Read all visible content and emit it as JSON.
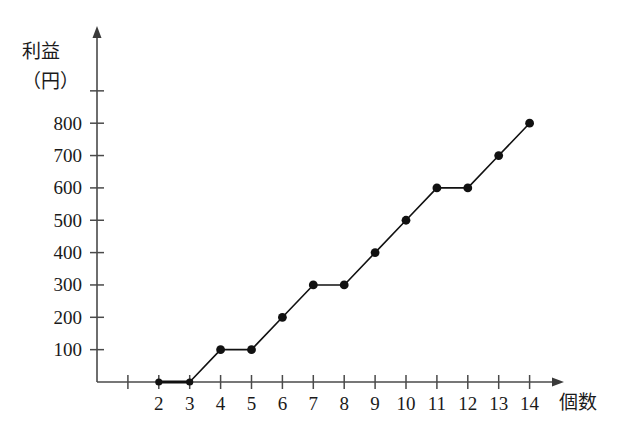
{
  "chart_data": {
    "type": "line",
    "title": "",
    "subtitle": "",
    "xlabel": "個数",
    "ylabel": "利益\n（円）",
    "ylabel_line1": "利益",
    "ylabel_line2": "（円）",
    "x": [
      2,
      3,
      4,
      5,
      6,
      7,
      8,
      9,
      10,
      11,
      12,
      13,
      14
    ],
    "values": [
      0,
      0,
      100,
      100,
      200,
      300,
      300,
      400,
      500,
      600,
      600,
      700,
      800
    ],
    "series": [
      {
        "name": "利益",
        "points": [
          {
            "x": 2,
            "y": 0
          },
          {
            "x": 3,
            "y": 0
          },
          {
            "x": 4,
            "y": 100
          },
          {
            "x": 5,
            "y": 100
          },
          {
            "x": 6,
            "y": 200
          },
          {
            "x": 7,
            "y": 300
          },
          {
            "x": 8,
            "y": 300
          },
          {
            "x": 9,
            "y": 400
          },
          {
            "x": 10,
            "y": 500
          },
          {
            "x": 11,
            "y": 600
          },
          {
            "x": 12,
            "y": 600
          },
          {
            "x": 13,
            "y": 700
          },
          {
            "x": 14,
            "y": 800
          }
        ]
      }
    ],
    "xticks": [
      1,
      2,
      3,
      4,
      5,
      6,
      7,
      8,
      9,
      10,
      11,
      12,
      13,
      14
    ],
    "xtick_labels": [
      "",
      "2",
      "3",
      "4",
      "5",
      "6",
      "7",
      "8",
      "9",
      "10",
      "11",
      "12",
      "13",
      "14"
    ],
    "yticks": [
      100,
      200,
      300,
      400,
      500,
      600,
      700,
      800,
      900
    ],
    "ytick_labels": [
      "100",
      "200",
      "300",
      "400",
      "500",
      "600",
      "700",
      "800",
      ""
    ],
    "xlim": [
      0,
      15.6
    ],
    "ylim": [
      0,
      980
    ],
    "grid": false,
    "legend": false,
    "legend_position": "none",
    "marker": "filled-circle",
    "line_color": "#111111",
    "axis_color": "#4a4a4a",
    "background_color": "#ffffff"
  },
  "axes": {
    "y_label_line1": "利益",
    "y_label_line2": "（円）",
    "x_label": "個数"
  }
}
